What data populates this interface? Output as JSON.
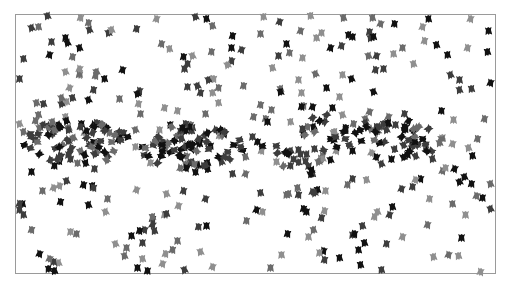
{
  "scene": {
    "description": "Flocking (boids) simulation snapshot",
    "frame": {
      "x": 15,
      "y": 14,
      "w": 481,
      "h": 260,
      "border": "#9a9a9a"
    },
    "shades": [
      "#111111",
      "#3d3d3d",
      "#6b6b6b",
      "#8f8f8f"
    ],
    "clusters": [
      {
        "cx": 75,
        "cy": 142,
        "rx": 55,
        "ry": 22,
        "n": 70
      },
      {
        "cx": 190,
        "cy": 148,
        "rx": 55,
        "ry": 24,
        "n": 70
      },
      {
        "cx": 395,
        "cy": 140,
        "rx": 55,
        "ry": 22,
        "n": 45
      },
      {
        "cx": 300,
        "cy": 140,
        "rx": 45,
        "ry": 35,
        "n": 30
      }
    ],
    "scatter_count": 330,
    "seed": 7
  }
}
